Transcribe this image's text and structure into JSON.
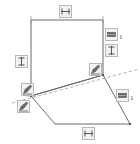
{
  "viewport": {
    "width": 140,
    "height": 144,
    "background": "#ffffff"
  },
  "colors": {
    "geometry_line": "#6b6b6b",
    "construction_line": "#9a9a9a",
    "badge_fill": "#f2f2f2",
    "badge_border": "#b8b8b8",
    "glyph": "#555555",
    "subscript_text": "#3a3a3a"
  },
  "sketch": {
    "name": "cad-sketch",
    "description": "Two connected planar faces with dimension and constraint badges",
    "vertical_face": {
      "name": "vertical-rectangle-face",
      "points": [
        [
          31,
          20
        ],
        [
          103,
          20
        ],
        [
          103,
          75
        ],
        [
          31,
          96
        ]
      ]
    },
    "ground_face": {
      "name": "ground-quadrilateral-face",
      "points": [
        [
          31,
          96
        ],
        [
          103,
          75
        ],
        [
          130,
          124
        ],
        [
          55,
          124
        ]
      ]
    },
    "construction_line": {
      "name": "construction-axis",
      "points": [
        [
          12,
          103
        ],
        [
          139,
          69
        ]
      ],
      "style": "dashed"
    }
  },
  "badges": [
    {
      "id": "top-horizontal-dimension",
      "name": "badge-horizontal-dimension-top",
      "icon": "horizontal-dimension-icon",
      "subscript": "",
      "x": 59,
      "y": 5,
      "interactable": true
    },
    {
      "id": "left-vertical-dimension",
      "name": "badge-vertical-dimension-left",
      "icon": "vertical-dimension-icon",
      "subscript": "",
      "x": 15,
      "y": 55,
      "interactable": true
    },
    {
      "id": "right-extrude-1",
      "name": "badge-extrude-right-1",
      "icon": "extrude-icon",
      "subscript": "1",
      "x": 105,
      "y": 28,
      "interactable": true
    },
    {
      "id": "right-vertical-dimension",
      "name": "badge-vertical-dimension-right",
      "icon": "vertical-dimension-icon",
      "subscript": "",
      "x": 105,
      "y": 44,
      "interactable": true
    },
    {
      "id": "mid-right-sketch-edit",
      "name": "badge-sketch-edit-mid-right",
      "icon": "pencil-edit-icon",
      "subscript": "",
      "x": 89,
      "y": 63,
      "interactable": true
    },
    {
      "id": "mid-left-sketch-edit",
      "name": "badge-sketch-edit-mid-left",
      "icon": "pencil-edit-icon",
      "subscript": "",
      "x": 21,
      "y": 83,
      "interactable": true
    },
    {
      "id": "lower-left-sketch-edit",
      "name": "badge-sketch-edit-lower-left",
      "icon": "pencil-edit-icon",
      "subscript": "",
      "x": 17,
      "y": 100,
      "interactable": true
    },
    {
      "id": "lower-right-extrude-1",
      "name": "badge-extrude-lower-right-1",
      "icon": "extrude-icon",
      "subscript": "1",
      "x": 116,
      "y": 89,
      "interactable": true
    },
    {
      "id": "bottom-horizontal-dimension",
      "name": "badge-horizontal-dimension-bottom",
      "icon": "horizontal-dimension-icon",
      "subscript": "",
      "x": 82,
      "y": 127,
      "interactable": true
    }
  ]
}
